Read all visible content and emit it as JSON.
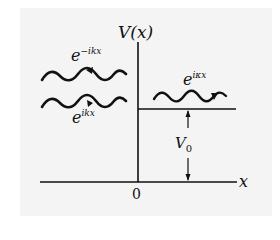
{
  "diagram": {
    "axis_y_label": "V(x)",
    "axis_x_label": "x",
    "origin_label": "0",
    "potential_label": {
      "base": "V",
      "sub": "0"
    },
    "waves": [
      {
        "name": "reflected",
        "base": "e",
        "exp": "−ikx",
        "direction": "left"
      },
      {
        "name": "incident",
        "base": "e",
        "exp": "ikx",
        "direction": "right"
      },
      {
        "name": "transmitted",
        "base": "e",
        "exp": "iκx",
        "direction": "right"
      }
    ],
    "colors": {
      "ink": "#111111",
      "background": "#f4f4f4"
    }
  }
}
